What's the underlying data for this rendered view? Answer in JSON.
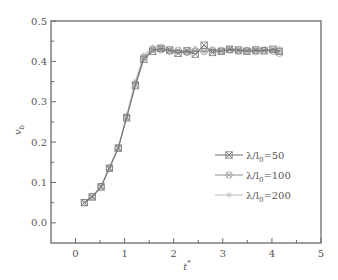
{
  "chart_data": {
    "type": "line",
    "title": "",
    "xlabel": "t*",
    "ylabel": "v_b",
    "xlim": [
      -0.5,
      5
    ],
    "ylim": [
      -0.05,
      0.5
    ],
    "xticks": [
      0,
      1,
      2,
      3,
      4,
      5
    ],
    "xtick_labels": [
      "0",
      "1",
      "2",
      "3",
      "4",
      "5"
    ],
    "yticks": [
      0.0,
      0.1,
      0.2,
      0.3,
      0.4,
      0.5
    ],
    "ytick_labels": [
      "0.0",
      "0.1",
      "0.2",
      "0.3",
      "0.4",
      "0.5"
    ],
    "grid": false,
    "legend_position": "center right",
    "series": [
      {
        "name": "λ/l₀=50",
        "marker": "x-square",
        "color": "#7a7a7a",
        "x": [
          0.18,
          0.34,
          0.52,
          0.69,
          0.87,
          1.04,
          1.22,
          1.39,
          1.57,
          1.74,
          1.92,
          2.09,
          2.27,
          2.44,
          2.62,
          2.79,
          2.97,
          3.14,
          3.32,
          3.49,
          3.67,
          3.84,
          4.02,
          4.15
        ],
        "y": [
          0.05,
          0.064,
          0.089,
          0.135,
          0.185,
          0.26,
          0.34,
          0.405,
          0.425,
          0.432,
          0.428,
          0.42,
          0.426,
          0.418,
          0.44,
          0.422,
          0.425,
          0.43,
          0.428,
          0.425,
          0.428,
          0.426,
          0.43,
          0.425
        ]
      },
      {
        "name": "λ/l₀=100",
        "marker": "circle-x",
        "color": "#9a9a9a",
        "x": [
          0.18,
          0.34,
          0.52,
          0.69,
          0.87,
          1.04,
          1.22,
          1.39,
          1.57,
          1.74,
          1.92,
          2.09,
          2.27,
          2.44,
          2.62,
          2.79,
          2.97,
          3.14,
          3.32,
          3.49,
          3.67,
          3.84,
          4.02,
          4.15
        ],
        "y": [
          0.05,
          0.065,
          0.09,
          0.136,
          0.186,
          0.262,
          0.345,
          0.41,
          0.43,
          0.428,
          0.425,
          0.428,
          0.422,
          0.426,
          0.424,
          0.428,
          0.426,
          0.428,
          0.425,
          0.427,
          0.424,
          0.428,
          0.425,
          0.42
        ]
      },
      {
        "name": "λ/l₀=200",
        "marker": "star",
        "color": "#c4c4c4",
        "x": [
          0.18,
          0.34,
          0.52,
          0.69,
          0.87,
          1.04,
          1.22,
          1.39,
          1.57,
          1.74,
          1.92,
          2.09,
          2.27,
          2.44,
          2.62,
          2.79,
          2.97,
          3.14,
          3.32,
          3.49,
          3.67,
          3.84,
          4.02,
          4.15
        ],
        "y": [
          0.051,
          0.066,
          0.091,
          0.137,
          0.188,
          0.265,
          0.35,
          0.415,
          0.435,
          0.438,
          0.43,
          0.425,
          0.428,
          0.432,
          0.426,
          0.43,
          0.428,
          0.432,
          0.43,
          0.428,
          0.432,
          0.43,
          0.428,
          0.432
        ]
      }
    ]
  }
}
